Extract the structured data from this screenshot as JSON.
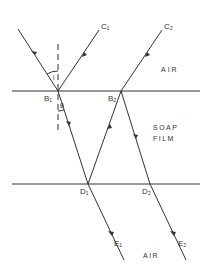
{
  "diagram": {
    "regions": {
      "top": "AIR",
      "middle_line1": "SOAP",
      "middle_line2": "FILM",
      "bottom": "AIR"
    },
    "points": {
      "B1": "B₁",
      "B2": "B₂",
      "C1": "C₁",
      "C2": "C₂",
      "D1": "D₁",
      "D2": "D₂",
      "E1": "E₁",
      "E2": "E₂"
    },
    "angles": {
      "incidence": "i",
      "refraction": "θ"
    },
    "colors": {
      "line": "#333333",
      "background": "#ffffff"
    }
  }
}
